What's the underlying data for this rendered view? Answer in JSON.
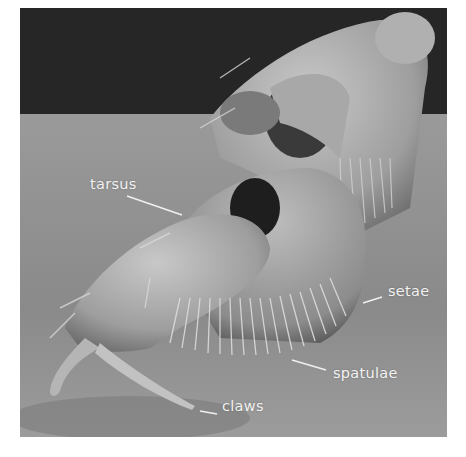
{
  "figure": {
    "background_colors": {
      "top_band": "#262626",
      "substrate": "#8e8e8e",
      "specimen_light": "#c9c9c9",
      "label_text": "#f2f2f2"
    },
    "labels": [
      {
        "id": "tarsus",
        "text": "tarsus"
      },
      {
        "id": "setae",
        "text": "setae"
      },
      {
        "id": "spatulae",
        "text": "spatulae"
      },
      {
        "id": "claws",
        "text": "claws"
      }
    ]
  }
}
